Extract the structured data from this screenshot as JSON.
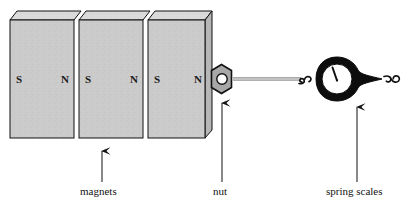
{
  "figure": {
    "background": "#ffffff",
    "width": 417,
    "height": 208
  },
  "colors": {
    "magnet_face": "#c9c9c9",
    "magnet_top": "#d8d8d8",
    "magnet_side": "#b0b0b0",
    "outline": "#111111",
    "nut_fill": "#a8a8a8",
    "nut_hole": "#ffffff",
    "string": "#c0c0c0",
    "scale_body": "#0d0d0d",
    "scale_dial": "#ffffff",
    "needle": "#111111",
    "label_text": "#111111"
  },
  "magnets": {
    "count": 3,
    "blocks": [
      {
        "left_pole": "S",
        "right_pole": "N"
      },
      {
        "left_pole": "S",
        "right_pole": "N"
      },
      {
        "left_pole": "S",
        "right_pole": "N"
      }
    ],
    "pole_sequence": [
      "S",
      "N",
      "S",
      "N",
      "S",
      "N"
    ]
  },
  "nut": {
    "shape": "hexagon",
    "hole": "circle"
  },
  "spring_scale": {
    "shape": "teardrop",
    "dial": "circular",
    "needle_angle_deg": -20,
    "hooks": [
      "left-s-hook",
      "right-s-hook"
    ]
  },
  "string": {
    "description": "thin line from nut to left hook"
  },
  "callouts": [
    {
      "key": "magnets",
      "label": "magnets",
      "arrow": "up"
    },
    {
      "key": "nut",
      "label": "nut",
      "arrow": "up"
    },
    {
      "key": "spring_scales",
      "label": "spring scales",
      "arrow": "up"
    }
  ],
  "labels": {
    "magnets": "magnets",
    "nut": "nut",
    "spring_scales": "spring scales",
    "pole_s": "S",
    "pole_n": "N"
  }
}
